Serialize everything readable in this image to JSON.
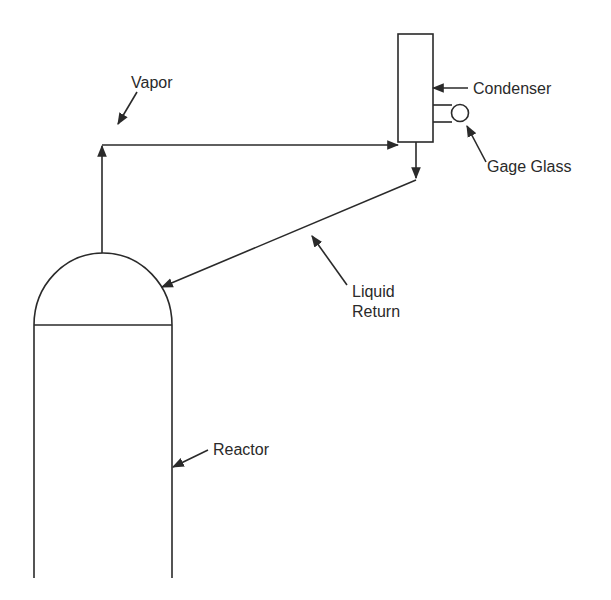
{
  "diagram": {
    "type": "process-flow",
    "components": [
      {
        "id": "reactor",
        "label": "Reactor"
      },
      {
        "id": "condenser",
        "label": "Condenser"
      },
      {
        "id": "gage-glass",
        "label": "Gage Glass"
      }
    ],
    "streams": [
      {
        "id": "vapor",
        "label": "Vapor",
        "from": "reactor",
        "to": "condenser"
      },
      {
        "id": "liquid-return",
        "label_line1": "Liquid",
        "label_line2": "Return",
        "from": "condenser",
        "to": "reactor"
      }
    ],
    "colors": {
      "line": "#2a2a2a",
      "background": "#ffffff"
    }
  },
  "labels": {
    "vapor": "Vapor",
    "condenser": "Condenser",
    "gage_glass": "Gage Glass",
    "liquid": "Liquid",
    "return": "Return",
    "reactor": "Reactor"
  }
}
